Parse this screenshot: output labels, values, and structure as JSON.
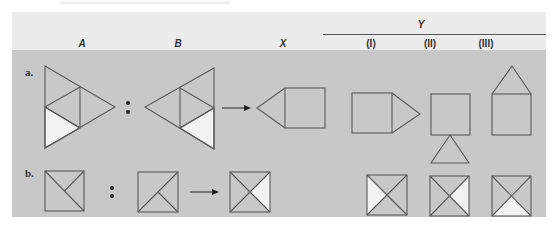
{
  "header": {
    "columns": {
      "a": "A",
      "b": "B",
      "x": "X",
      "y": "Y",
      "y1": "(I)",
      "y2": "(II)",
      "y3": "(III)"
    }
  },
  "rows": [
    {
      "label": "a.",
      "separator": ":"
    },
    {
      "label": "b.",
      "separator": ":"
    }
  ],
  "colors": {
    "header_band": "#ececec",
    "panel": "#c8c8c8",
    "stroke": "#5a5a5a",
    "highlight": "#f2f2f2"
  }
}
